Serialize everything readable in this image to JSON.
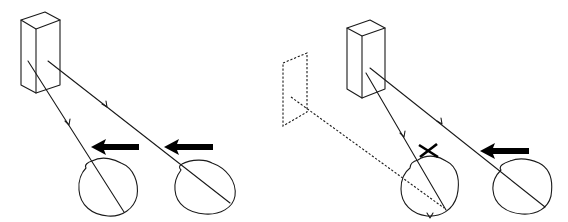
{
  "diagram": {
    "colors": {
      "line": "#1a1a1a",
      "arrow": "#000000",
      "background": "#ffffff"
    },
    "panels": [
      {
        "id": "left",
        "object": "rectangular-block",
        "eyes": [
          {
            "id": "eye-1",
            "movement": "left",
            "ray": "solid",
            "crossed_out": false
          },
          {
            "id": "eye-2",
            "movement": "left",
            "ray": "solid",
            "crossed_out": false
          }
        ],
        "afterimage_plane": false
      },
      {
        "id": "right",
        "object": "rectangular-block",
        "eyes": [
          {
            "id": "eye-1",
            "movement": "none",
            "ray": "solid",
            "crossed_out": true,
            "extra_ray": "dashed-to-afterimage-plane"
          },
          {
            "id": "eye-2",
            "movement": "left",
            "ray": "solid",
            "crossed_out": false
          }
        ],
        "afterimage_plane": true
      }
    ],
    "icons": {
      "movement_arrow": "arrow-left-icon",
      "blocked_marker": "cross-x-icon"
    }
  }
}
